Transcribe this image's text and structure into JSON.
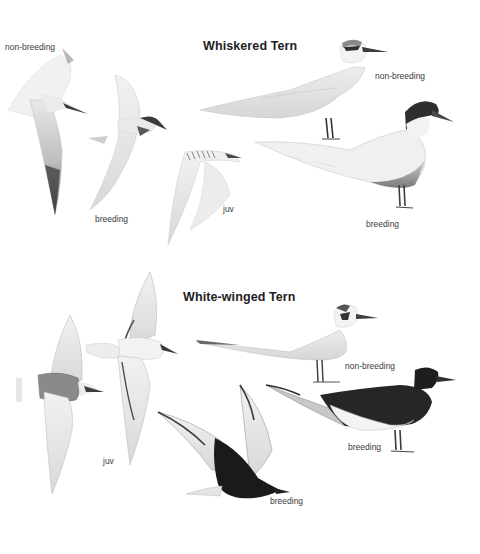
{
  "plate": {
    "species": [
      {
        "name": "Whiskered Tern",
        "figures": [
          {
            "id": "flight-nonbreeding",
            "pose": "flight",
            "plumage": "non-breeding",
            "label": "non-breeding"
          },
          {
            "id": "flight-breeding",
            "pose": "flight",
            "plumage": "breeding",
            "label": "breeding"
          },
          {
            "id": "flight-juv",
            "pose": "flight",
            "plumage": "juvenile",
            "label": "juv"
          },
          {
            "id": "standing-nonbreeding",
            "pose": "standing",
            "plumage": "non-breeding",
            "label": "non-breeding"
          },
          {
            "id": "standing-breeding",
            "pose": "standing",
            "plumage": "breeding",
            "label": "breeding"
          }
        ]
      },
      {
        "name": "White-winged Tern",
        "figures": [
          {
            "id": "flight-juv-a",
            "pose": "flight (from below)",
            "plumage": "juvenile",
            "label": ""
          },
          {
            "id": "flight-juv-b",
            "pose": "flight (from above)",
            "plumage": "juvenile",
            "label": "juv"
          },
          {
            "id": "standing-nonbreeding",
            "pose": "standing",
            "plumage": "non-breeding",
            "label": "non-breeding"
          },
          {
            "id": "flight-breeding",
            "pose": "flight",
            "plumage": "breeding",
            "label": "breeding"
          },
          {
            "id": "standing-breeding",
            "pose": "standing",
            "plumage": "breeding",
            "label": "breeding"
          }
        ]
      }
    ],
    "colors": {
      "background": "#ffffff",
      "pale_grey": "#e6e6e6",
      "mid_grey": "#9a9a9a",
      "dark_grey": "#4a4a4a",
      "black_plumage": "#1a1a1a",
      "bill_dark": "#3c3c3c"
    }
  }
}
